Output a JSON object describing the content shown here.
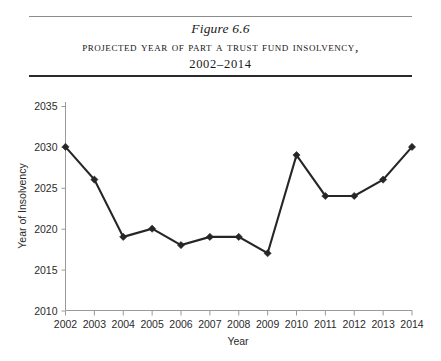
{
  "figure": {
    "number": "Figure 6.6",
    "title": "Projected Year of Part A Trust Fund Insolvency,",
    "range": "2002–2014"
  },
  "chart_data": {
    "type": "line",
    "title": "Projected Year of Part A Trust Fund Insolvency, 2002–2014",
    "xlabel": "Year",
    "ylabel": "Year of Insolvency",
    "categories": [
      2002,
      2003,
      2004,
      2005,
      2006,
      2007,
      2008,
      2009,
      2010,
      2011,
      2012,
      2013,
      2014
    ],
    "values": [
      2030,
      2026,
      2019,
      2020,
      2018,
      2019,
      2019,
      2017,
      2029,
      2024,
      2024,
      2026,
      2030
    ],
    "x_tick_labels": [
      "2002",
      "2003",
      "2004",
      "2005",
      "2006",
      "2007",
      "2008",
      "2009",
      "2010",
      "2011",
      "2012",
      "2013",
      "2014"
    ],
    "y_tick_labels": [
      "2010",
      "2015",
      "2020",
      "2025",
      "2030",
      "2035"
    ],
    "y_ticks": [
      2010,
      2015,
      2020,
      2025,
      2030,
      2035
    ],
    "ylim": [
      2010,
      2035
    ],
    "xlim": [
      2002,
      2014
    ],
    "grid": false,
    "legend": null,
    "marker": "diamond",
    "series_color": "#262626",
    "axis_color": "#9a9a9a"
  }
}
